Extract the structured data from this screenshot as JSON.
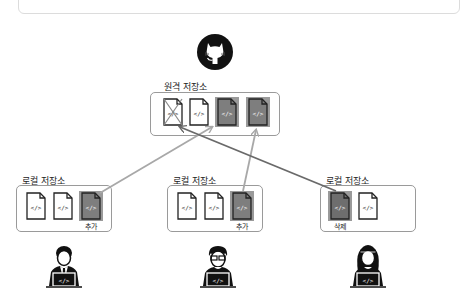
{
  "remote": {
    "label": "원격 저장소",
    "icon": "github-icon",
    "files": [
      {
        "state": "deleted"
      },
      {
        "state": "normal"
      },
      {
        "state": "added"
      },
      {
        "state": "added"
      }
    ]
  },
  "locals": [
    {
      "label": "로컬 저장소",
      "files": [
        {
          "state": "normal"
        },
        {
          "state": "normal"
        },
        {
          "state": "added",
          "tag": "추가"
        }
      ],
      "user": "developer-man-icon"
    },
    {
      "label": "로컬 저장소",
      "files": [
        {
          "state": "normal"
        },
        {
          "state": "normal"
        },
        {
          "state": "added",
          "tag": "추가"
        }
      ],
      "user": "developer-glasses-icon"
    },
    {
      "label": "로컬 저장소",
      "files": [
        {
          "state": "deleted-local",
          "tag": "삭제"
        },
        {
          "state": "normal"
        }
      ],
      "user": "developer-woman-icon"
    }
  ],
  "colors": {
    "arrow": "#a8a8a8",
    "arrow_dark": "#6a6a6a",
    "file_highlight": "#8c8c8c",
    "border": "#9a9a9a"
  }
}
